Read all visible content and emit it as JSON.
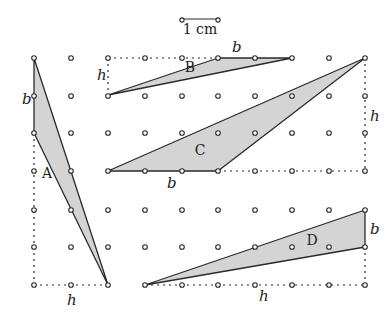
{
  "diagram": {
    "scale_bar": {
      "label": "1 cm",
      "x1": 182,
      "x2": 218,
      "y": 19
    },
    "grid": {
      "xs": [
        34,
        71,
        108,
        145,
        182,
        218,
        255,
        292,
        329,
        365
      ],
      "ys": [
        58,
        96,
        133,
        171,
        210,
        247,
        285
      ]
    },
    "colors": {
      "fill": "#d4d4d4",
      "stroke": "#2a2a2a",
      "dot": "#2a2a2a"
    },
    "triangles": [
      {
        "id": "A",
        "label": "A",
        "points": [
          [
            34,
            58
          ],
          [
            34,
            133
          ],
          [
            108,
            285
          ]
        ],
        "label_pos": [
          47,
          178
        ]
      },
      {
        "id": "B",
        "label": "B",
        "points": [
          [
            108,
            95
          ],
          [
            218,
            58
          ],
          [
            292,
            58
          ]
        ],
        "label_pos": [
          190,
          72
        ]
      },
      {
        "id": "C",
        "label": "C",
        "points": [
          [
            108,
            171
          ],
          [
            218,
            171
          ],
          [
            365,
            58
          ]
        ],
        "label_pos": [
          200,
          155
        ]
      },
      {
        "id": "D",
        "label": "D",
        "points": [
          [
            145,
            285
          ],
          [
            365,
            210
          ],
          [
            365,
            247
          ]
        ],
        "label_pos": [
          312,
          245
        ]
      }
    ],
    "guides": [
      [
        [
          108,
          58
        ],
        [
          218,
          58
        ]
      ],
      [
        [
          108,
          58
        ],
        [
          108,
          95
        ]
      ],
      [
        [
          34,
          133
        ],
        [
          34,
          285
        ]
      ],
      [
        [
          34,
          285
        ],
        [
          108,
          285
        ]
      ],
      [
        [
          218,
          171
        ],
        [
          365,
          171
        ]
      ],
      [
        [
          365,
          58
        ],
        [
          365,
          171
        ]
      ],
      [
        [
          145,
          285
        ],
        [
          365,
          285
        ]
      ],
      [
        [
          365,
          247
        ],
        [
          365,
          285
        ]
      ]
    ],
    "measure_labels": [
      {
        "text": "b",
        "x": 22,
        "y": 104
      },
      {
        "text": "h",
        "x": 97,
        "y": 80
      },
      {
        "text": "b",
        "x": 232,
        "y": 52
      },
      {
        "text": "b",
        "x": 167,
        "y": 188
      },
      {
        "text": "h",
        "x": 370,
        "y": 121
      },
      {
        "text": "h",
        "x": 67,
        "y": 305
      },
      {
        "text": "b",
        "x": 370,
        "y": 234
      },
      {
        "text": "h",
        "x": 259,
        "y": 301
      }
    ]
  }
}
